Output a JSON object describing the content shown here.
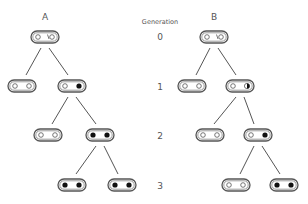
{
  "labels": {
    "tree_a": "A",
    "tree_b": "B",
    "generation_header": "Generation",
    "generations": [
      "0",
      "1",
      "2",
      "3"
    ]
  },
  "colors": {
    "stroke": "#555555",
    "fill_dark": "#111111",
    "background": "#ffffff"
  },
  "tree_a": {
    "nodes": [
      {
        "gen": 0,
        "x": 45,
        "y": 37,
        "sites": [
          "open",
          "open-nick"
        ]
      },
      {
        "gen": 1,
        "x": 22,
        "y": 86,
        "sites": [
          "open",
          "open"
        ]
      },
      {
        "gen": 1,
        "x": 72,
        "y": 86,
        "sites": [
          "open",
          "filled"
        ]
      },
      {
        "gen": 2,
        "x": 48,
        "y": 135,
        "sites": [
          "open",
          "open"
        ]
      },
      {
        "gen": 2,
        "x": 100,
        "y": 135,
        "sites": [
          "filled",
          "filled"
        ]
      },
      {
        "gen": 3,
        "x": 72,
        "y": 185,
        "sites": [
          "filled",
          "filled"
        ]
      },
      {
        "gen": 3,
        "x": 122,
        "y": 185,
        "sites": [
          "filled",
          "filled"
        ]
      }
    ]
  },
  "tree_b": {
    "nodes": [
      {
        "gen": 0,
        "x": 214,
        "y": 37,
        "sites": [
          "open",
          "open-nick"
        ]
      },
      {
        "gen": 1,
        "x": 192,
        "y": 86,
        "sites": [
          "open",
          "open"
        ]
      },
      {
        "gen": 1,
        "x": 240,
        "y": 86,
        "sites": [
          "open",
          "half"
        ]
      },
      {
        "gen": 2,
        "x": 210,
        "y": 135,
        "sites": [
          "open",
          "open"
        ]
      },
      {
        "gen": 2,
        "x": 258,
        "y": 135,
        "sites": [
          "open",
          "filled"
        ]
      },
      {
        "gen": 3,
        "x": 236,
        "y": 185,
        "sites": [
          "open",
          "open"
        ]
      },
      {
        "gen": 3,
        "x": 284,
        "y": 185,
        "sites": [
          "filled",
          "filled"
        ]
      }
    ]
  }
}
